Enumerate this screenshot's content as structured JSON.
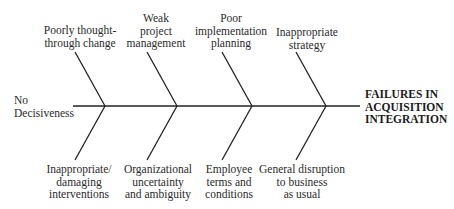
{
  "diagram": {
    "type": "fishbone",
    "effect": {
      "lines": [
        "FAILURES IN",
        "ACQUISITION",
        "INTEGRATION"
      ]
    },
    "tail": {
      "lines": [
        "No",
        "Decisiveness"
      ]
    },
    "upper_causes": [
      {
        "lines": [
          "Poorly thought-",
          "through change"
        ]
      },
      {
        "lines": [
          "Weak",
          "project",
          "management"
        ]
      },
      {
        "lines": [
          "Poor",
          "implementation",
          "planning"
        ]
      },
      {
        "lines": [
          "Inappropriate",
          "strategy"
        ]
      }
    ],
    "lower_causes": [
      {
        "lines": [
          "Inappropriate/",
          "damaging",
          "interventions"
        ]
      },
      {
        "lines": [
          "Organizational",
          "uncertainty",
          "and ambiguity"
        ]
      },
      {
        "lines": [
          "Employee",
          "terms and",
          "conditions"
        ]
      },
      {
        "lines": [
          "General disruption",
          "to business",
          "as usual"
        ]
      }
    ],
    "line_color": "#222222"
  }
}
